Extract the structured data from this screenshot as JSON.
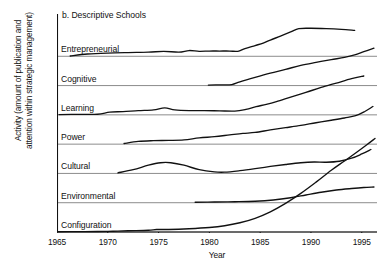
{
  "figure": {
    "panel_label": "b. Descriptive Schools",
    "y_axis_label_line1": "Activity (amount of publication and",
    "y_axis_label_line2": "attention within strategic management)",
    "x_axis_label": "Year",
    "line_color": "#111111",
    "gridline_color": "#6f6f6f",
    "background": "#ffffff"
  },
  "chart_data": {
    "type": "line",
    "title": "b. Descriptive Schools",
    "xlabel": "Year",
    "ylabel": "Activity (amount of publication and attention within strategic management)",
    "xlim": [
      1965,
      1996.5
    ],
    "ylim": [
      0,
      7
    ],
    "grid": true,
    "legend": "none (series labelled in-plot above each baseline)",
    "x_ticks": [
      1965,
      1970,
      1975,
      1980,
      1985,
      1990,
      1995
    ],
    "x_tick_labels": [
      "1965",
      "1970",
      "1975",
      "1980",
      "1985",
      "1990",
      "1995"
    ],
    "note": "Seven stacked band panels; each series rides on its own baseline. y values are relative activity units above that series' own baseline.",
    "series": [
      {
        "name": "Entrepreneurial",
        "baseline_row": 0,
        "x": [
          1966.3,
          1968,
          1970,
          1972,
          1974,
          1975.5,
          1977,
          1978,
          1979,
          1980,
          1981,
          1982,
          1982.8,
          1983.5,
          1984.5,
          1985.3,
          1986,
          1987,
          1988,
          1988.8,
          1990,
          1991.5,
          1993,
          1994.3
        ],
        "y": [
          0.02,
          0.18,
          0.26,
          0.3,
          0.33,
          0.4,
          0.33,
          0.46,
          0.4,
          0.42,
          0.42,
          0.42,
          0.4,
          0.62,
          0.86,
          1.06,
          1.3,
          1.62,
          1.95,
          2.22,
          2.25,
          2.22,
          2.16,
          2.08
        ]
      },
      {
        "name": "Cognitive",
        "baseline_row": 1,
        "x": [
          1979.9,
          1981,
          1982.2,
          1983,
          1984.5,
          1986,
          1987.5,
          1989,
          1990.5,
          1992,
          1993.3,
          1994.3,
          1995.2,
          1996.2
        ],
        "y": [
          0.04,
          0.06,
          0.08,
          0.3,
          0.66,
          1.0,
          1.3,
          1.62,
          1.86,
          2.08,
          2.26,
          2.46,
          2.72,
          3.0
        ]
      },
      {
        "name": "Learning",
        "baseline_row": 2,
        "x": [
          1965.2,
          1967,
          1969,
          1970.2,
          1971.5,
          1973,
          1974.5,
          1975.6,
          1976.6,
          1978,
          1979.5,
          1981,
          1982.5,
          1983.6,
          1984.6,
          1985.6,
          1986.6,
          1988,
          1989.5,
          1991,
          1992.5,
          1994,
          1995.2
        ],
        "y": [
          0.02,
          0.04,
          0.05,
          0.22,
          0.26,
          0.34,
          0.4,
          0.56,
          0.4,
          0.34,
          0.34,
          0.32,
          0.3,
          0.44,
          0.66,
          0.84,
          1.06,
          1.42,
          1.8,
          2.2,
          2.55,
          2.9,
          3.12
        ]
      },
      {
        "name": "Power",
        "baseline_row": 3,
        "x": [
          1971.6,
          1973,
          1974.5,
          1976,
          1977.5,
          1979,
          1980.5,
          1982,
          1983.3,
          1984.5,
          1986,
          1987.5,
          1989,
          1990.5,
          1992,
          1993.3,
          1994.4,
          1995.3,
          1996.1
        ],
        "y": [
          0.05,
          0.22,
          0.28,
          0.3,
          0.34,
          0.5,
          0.6,
          0.74,
          0.86,
          0.94,
          1.14,
          1.32,
          1.5,
          1.72,
          1.92,
          2.1,
          2.28,
          2.62,
          3.02
        ]
      },
      {
        "name": "Cultural",
        "baseline_row": 4,
        "x": [
          1971.0,
          1972.5,
          1974,
          1975.2,
          1976.2,
          1977.5,
          1979,
          1980.5,
          1981.5,
          1983,
          1984.5,
          1986,
          1987.5,
          1989,
          1990.3,
          1991.5,
          1992.8,
          1994,
          1995,
          1995.9
        ],
        "y": [
          0.05,
          0.3,
          0.66,
          0.86,
          0.86,
          0.66,
          0.3,
          0.12,
          0.1,
          0.22,
          0.38,
          0.56,
          0.72,
          0.86,
          0.92,
          0.9,
          0.98,
          1.22,
          1.56,
          1.92
        ]
      },
      {
        "name": "Environmental",
        "baseline_row": 5,
        "x": [
          1978.6,
          1980.5,
          1982.5,
          1984.5,
          1986.3,
          1988,
          1989.5,
          1991,
          1992.5,
          1994,
          1995.2,
          1996.2
        ],
        "y": [
          0.04,
          0.06,
          0.08,
          0.12,
          0.22,
          0.4,
          0.62,
          0.84,
          1.02,
          1.14,
          1.22,
          1.26
        ]
      },
      {
        "name": "Configuration",
        "baseline_row": 6,
        "x": [
          1965.0,
          1967,
          1969,
          1970.5,
          1972,
          1974,
          1974.8,
          1976,
          1978,
          1980,
          1981.5,
          1983,
          1984.5,
          1986,
          1987.5,
          1989,
          1990.5,
          1992,
          1993.3,
          1994.5,
          1995.5,
          1996.3
        ],
        "y": [
          0.02,
          0.03,
          0.04,
          0.06,
          0.1,
          0.14,
          0.2,
          0.2,
          0.26,
          0.36,
          0.5,
          0.74,
          1.1,
          1.62,
          2.3,
          3.1,
          4.0,
          4.95,
          5.7,
          6.4,
          7.0,
          7.5
        ]
      }
    ]
  },
  "rows": [
    {
      "label": "Entrepreneurial"
    },
    {
      "label": "Cognitive"
    },
    {
      "label": "Learning"
    },
    {
      "label": "Power"
    },
    {
      "label": "Cultural"
    },
    {
      "label": "Environmental"
    },
    {
      "label": "Configuration"
    }
  ]
}
